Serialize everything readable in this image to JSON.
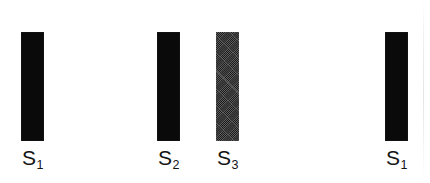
{
  "figure": {
    "background_color": "#ffffff",
    "width": 430,
    "height": 183
  },
  "chart_data": {
    "type": "bar",
    "orientation": "vertical",
    "title": "",
    "xlabel": "",
    "ylabel": "",
    "grid": false,
    "legend": false,
    "categories": [
      "S1",
      "S2",
      "S3",
      "S1"
    ],
    "labels_display": [
      "S",
      "S",
      "S",
      "S"
    ],
    "subscripts": [
      "1",
      "2",
      "3",
      "1"
    ],
    "values": [
      109,
      109,
      109,
      109
    ],
    "series": [
      {
        "name": "bar-height-px",
        "values": [
          109,
          109,
          109,
          109
        ]
      }
    ],
    "bars": [
      {
        "id": "bar-1",
        "label_main": "S",
        "label_sub": "1",
        "fill": "solid",
        "color": "#0a0a0a",
        "x": 21,
        "y": 32,
        "width": 23,
        "height": 109,
        "label_x": 21,
        "label_y": 147
      },
      {
        "id": "bar-2",
        "label_main": "S",
        "label_sub": "2",
        "fill": "solid",
        "color": "#0a0a0a",
        "x": 157,
        "y": 32,
        "width": 23,
        "height": 109,
        "label_x": 157,
        "label_y": 147
      },
      {
        "id": "bar-3",
        "label_main": "S",
        "label_sub": "3",
        "fill": "textured",
        "color": "#3e3e3e",
        "x": 216,
        "y": 32,
        "width": 23,
        "height": 109,
        "label_x": 216,
        "label_y": 147
      },
      {
        "id": "bar-4",
        "label_main": "S",
        "label_sub": "1",
        "fill": "solid",
        "color": "#0a0a0a",
        "x": 385,
        "y": 32,
        "width": 23,
        "height": 109,
        "label_x": 385,
        "label_y": 147
      }
    ]
  }
}
